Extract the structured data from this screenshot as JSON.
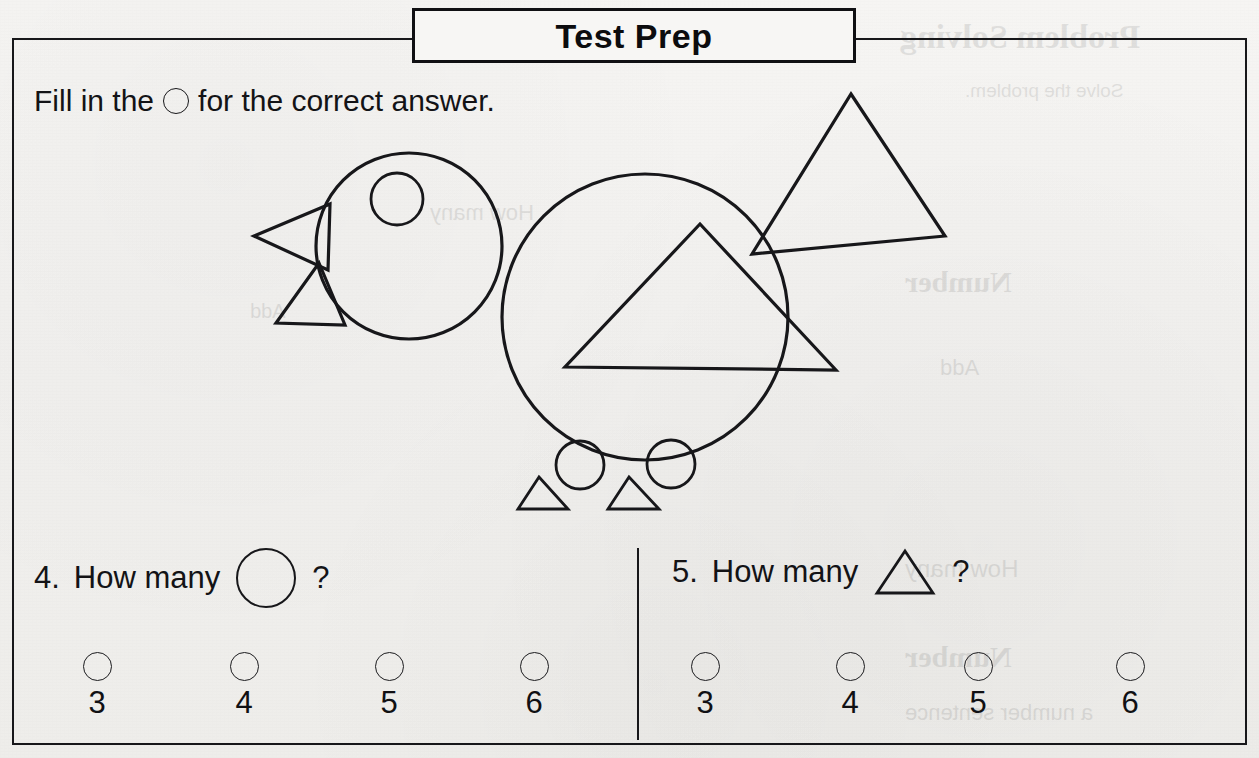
{
  "header": {
    "title": "Test Prep"
  },
  "instruction": {
    "before": "Fill in the",
    "bubble_icon": "circle-outline-icon",
    "after": "for the correct answer."
  },
  "figure": {
    "stroke_color": "#17171a",
    "shapes": [
      {
        "name": "head-circle",
        "type": "circle",
        "cx": 409,
        "cy": 246,
        "r": 93
      },
      {
        "name": "eye-circle",
        "type": "circle",
        "cx": 397,
        "cy": 199,
        "r": 26
      },
      {
        "name": "beak-triangle",
        "type": "triangle",
        "points": "254,236 330,204 328,270"
      },
      {
        "name": "chin-triangle",
        "type": "triangle",
        "points": "319,263 345,325 276,323"
      },
      {
        "name": "body-circle",
        "type": "circle",
        "cx": 645,
        "cy": 317,
        "r": 143
      },
      {
        "name": "body-triangle",
        "type": "triangle",
        "points": "700,224 836,370 565,367"
      },
      {
        "name": "wing-triangle",
        "type": "triangle",
        "points": "851,94 945,236 752,254"
      },
      {
        "name": "left-leg-circle",
        "type": "circle",
        "cx": 580,
        "cy": 465,
        "r": 24
      },
      {
        "name": "right-leg-circle",
        "type": "circle",
        "cx": 671,
        "cy": 464,
        "r": 24
      },
      {
        "name": "left-foot-triangle",
        "type": "triangle",
        "points": "539,477 568,509 518,509"
      },
      {
        "name": "right-foot-triangle",
        "type": "triangle",
        "points": "629,477 659,509 608,509"
      }
    ]
  },
  "questions": [
    {
      "number": "4.",
      "text": "How many",
      "shape_icon": "circle-outline-icon",
      "shape_type": "circle",
      "mark": "?",
      "choices": [
        "3",
        "4",
        "5",
        "6"
      ],
      "choice_icon": "answer-bubble-icon"
    },
    {
      "number": "5.",
      "text": "How many",
      "shape_icon": "triangle-outline-icon",
      "shape_type": "triangle",
      "mark": "?",
      "choices": [
        "3",
        "4",
        "5",
        "6"
      ],
      "choice_icon": "answer-bubble-icon"
    }
  ],
  "bleed_through": {
    "lines": [
      "Problem Solving",
      "Solve the problem.",
      "Number",
      "Add",
      "How many",
      "Number",
      "a number sentence"
    ]
  }
}
